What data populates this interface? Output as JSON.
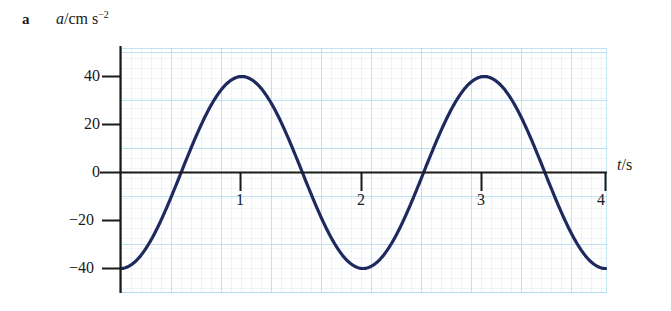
{
  "figure": {
    "part_label": "a",
    "y_caption": {
      "quantity": "a",
      "unit_main": "/cm s",
      "unit_exp": "−2"
    },
    "x_caption": {
      "quantity": "t",
      "slash": "/",
      "unit": "s"
    }
  },
  "colors": {
    "curve": "#1e2a5e",
    "axis": "#1a1a1a",
    "grid_minor": "#d6ecf7",
    "grid_major": "#9fd4ec",
    "background": "#ffffff"
  },
  "chart_data": {
    "type": "line",
    "title": "",
    "xlabel": "t/s",
    "ylabel": "a/cm s−2",
    "xlim": [
      -0.06,
      4.05
    ],
    "ylim": [
      -50,
      50
    ],
    "xticks": [
      "1",
      "2",
      "3",
      "4"
    ],
    "xtick_values": [
      1,
      2,
      3,
      4
    ],
    "yticks": [
      "40",
      "20",
      "0",
      "−20",
      "−40"
    ],
    "ytick_values": [
      40,
      20,
      0,
      -20,
      -40
    ],
    "grid": true,
    "grid_minor_step_x": 0.083,
    "grid_minor_step_y": 4,
    "grid_major_step_x": 0.417,
    "grid_major_step_y": 20,
    "legend": "none",
    "series": [
      {
        "name": "acceleration",
        "equation": "a = -40 cos(pi t)",
        "amplitude": 40,
        "period": 2,
        "x": [
          0.0,
          0.1,
          0.2,
          0.3,
          0.4,
          0.5,
          0.6,
          0.7,
          0.8,
          0.9,
          1.0,
          1.1,
          1.2,
          1.3,
          1.4,
          1.5,
          1.6,
          1.7,
          1.8,
          1.9,
          2.0,
          2.1,
          2.2,
          2.3,
          2.4,
          2.5,
          2.6,
          2.7,
          2.8,
          2.9,
          3.0,
          3.1,
          3.2,
          3.3,
          3.4,
          3.5,
          3.6,
          3.7,
          3.8,
          3.9,
          4.0
        ],
        "values": [
          -40,
          -38.0,
          -32.4,
          -23.5,
          -12.4,
          0,
          12.4,
          23.5,
          32.4,
          38.0,
          40,
          38.0,
          32.4,
          23.5,
          12.4,
          0,
          -12.4,
          -23.5,
          -32.4,
          -38.0,
          -40,
          -38.0,
          -32.4,
          -23.5,
          -12.4,
          0,
          12.4,
          23.5,
          32.4,
          38.0,
          40,
          38.0,
          32.4,
          23.5,
          12.4,
          0,
          -12.4,
          -23.5,
          -32.4,
          -38.0,
          -40
        ],
        "zero_crossings": [
          0.5,
          1.5,
          2.5,
          3.5
        ],
        "maxima": [
          {
            "t": 1,
            "a": 40
          },
          {
            "t": 3,
            "a": 40
          }
        ],
        "minima": [
          {
            "t": 0,
            "a": -40
          },
          {
            "t": 2,
            "a": -40
          },
          {
            "t": 4,
            "a": -40
          }
        ]
      }
    ]
  }
}
